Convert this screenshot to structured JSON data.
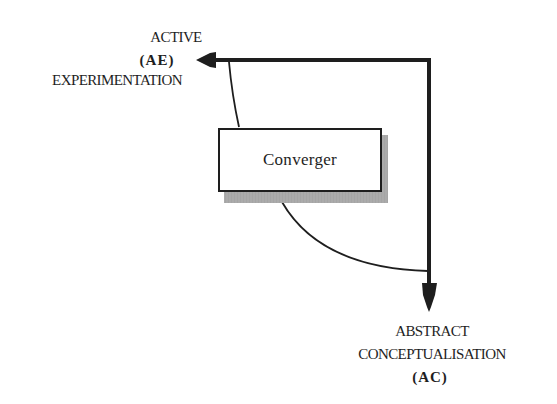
{
  "diagram": {
    "type": "learning-style-quadrant",
    "colors": {
      "ink": "#1e1e1e",
      "background": "#ffffff",
      "shadow": "#a8a8a8"
    },
    "axis_horizontal": {
      "label_top": "ACTIVE",
      "code": "(AE)",
      "label_bottom": "EXPERIMENTATION",
      "arrow_direction": "left"
    },
    "axis_vertical": {
      "label_top": "ABSTRACT",
      "label_mid": "CONCEPTUALISATION",
      "code": "(AC)",
      "arrow_direction": "down"
    },
    "quadrant": {
      "label": "Converger"
    }
  }
}
